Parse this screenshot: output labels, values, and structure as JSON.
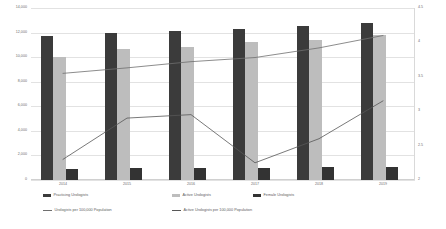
{
  "chart_data": {
    "type": "bar",
    "title": "",
    "subtitle": "",
    "xlabel": "",
    "ylabel": "",
    "y2label": "",
    "grid": true,
    "legend_position": "bottom",
    "categories": [
      "2014",
      "2015",
      "2016",
      "2017",
      "2018",
      "2019"
    ],
    "ylim": [
      0,
      14000
    ],
    "yticks": [
      "0",
      "2,000",
      "4,000",
      "6,000",
      "8,000",
      "10,000",
      "12,000",
      "14,000"
    ],
    "ytick_values": [
      0,
      2000,
      4000,
      6000,
      8000,
      10000,
      12000,
      14000
    ],
    "y2lim": [
      2,
      4.5
    ],
    "y2ticks": [
      "2",
      "2.5",
      "3",
      "3.5",
      "4",
      "4.5"
    ],
    "y2tick_values": [
      2,
      2.5,
      3,
      3.5,
      4,
      4.5
    ],
    "series": [
      {
        "name": "Practicing Urologists",
        "kind": "bar",
        "axis": "left",
        "color": "#3b3b3b",
        "values": [
          11700,
          12000,
          12150,
          12300,
          12500,
          12800
        ]
      },
      {
        "name": "Active Urologists",
        "kind": "bar",
        "axis": "left",
        "color": "#bdbdbd",
        "values": [
          10000,
          10700,
          10800,
          11200,
          11400,
          11800
        ]
      },
      {
        "name": "Female Urologists",
        "kind": "bar",
        "axis": "left",
        "color": "#333333",
        "values": [
          900,
          950,
          950,
          1000,
          1050,
          1100
        ]
      },
      {
        "name": "Urologists per 100,000 Population",
        "kind": "line",
        "axis": "right",
        "color": "#6f6f6f",
        "values": [
          3.55,
          3.63,
          3.72,
          3.78,
          3.92,
          4.1
        ]
      },
      {
        "name": "Active Urologists per 100,000 Population",
        "kind": "line",
        "axis": "right",
        "color": "#575757",
        "values": [
          2.3,
          2.9,
          2.95,
          2.25,
          2.6,
          3.15
        ]
      }
    ]
  },
  "legend": {
    "items": [
      {
        "label": "Practicing Urologists",
        "marker": "bar",
        "color": "#3b3b3b"
      },
      {
        "label": "Active Urologists",
        "marker": "bar",
        "color": "#bdbdbd"
      },
      {
        "label": "Female Urologists",
        "marker": "bar",
        "color": "#333333"
      },
      {
        "label": "Urologists per 100,000 Population",
        "marker": "line",
        "color": "#6f6f6f"
      },
      {
        "label": "Active Urologists per 100,000 Population",
        "marker": "line",
        "color": "#575757"
      }
    ]
  }
}
